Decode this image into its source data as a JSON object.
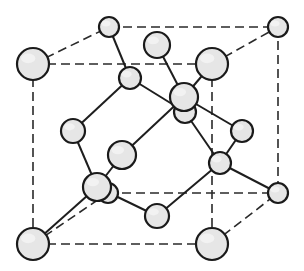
{
  "diagram": {
    "colors": {
      "atom_fill": "#e6e6e6",
      "atom_stroke": "#1a1a1a",
      "edge_stroke": "#2a2a2a",
      "background": "#ffffff"
    },
    "cube_edges": [
      {
        "from": [
          33,
          64
        ],
        "to": [
          212,
          64
        ]
      },
      {
        "from": [
          33,
          64
        ],
        "to": [
          33,
          244
        ]
      },
      {
        "from": [
          212,
          64
        ],
        "to": [
          212,
          244
        ]
      },
      {
        "from": [
          33,
          244
        ],
        "to": [
          212,
          244
        ]
      },
      {
        "from": [
          109,
          27
        ],
        "to": [
          278,
          27
        ]
      },
      {
        "from": [
          278,
          27
        ],
        "to": [
          278,
          193
        ]
      },
      {
        "from": [
          108,
          193
        ],
        "to": [
          278,
          193
        ]
      },
      {
        "from": [
          33,
          64
        ],
        "to": [
          109,
          27
        ]
      },
      {
        "from": [
          212,
          64
        ],
        "to": [
          278,
          27
        ]
      },
      {
        "from": [
          212,
          244
        ],
        "to": [
          278,
          193
        ]
      },
      {
        "from": [
          33,
          244
        ],
        "to": [
          108,
          193
        ]
      }
    ],
    "bonds": [
      {
        "from": [
          184,
          97
        ],
        "to": [
          157,
          45
        ]
      },
      {
        "from": [
          184,
          97
        ],
        "to": [
          212,
          64
        ]
      },
      {
        "from": [
          184,
          97
        ],
        "to": [
          242,
          131
        ]
      },
      {
        "from": [
          184,
          97
        ],
        "to": [
          122,
          155
        ]
      },
      {
        "from": [
          130,
          78
        ],
        "to": [
          109,
          27
        ]
      },
      {
        "from": [
          130,
          78
        ],
        "to": [
          73,
          131
        ]
      },
      {
        "from": [
          130,
          78
        ],
        "to": [
          185,
          112
        ]
      },
      {
        "from": [
          97,
          187
        ],
        "to": [
          73,
          131
        ]
      },
      {
        "from": [
          97,
          187
        ],
        "to": [
          122,
          155
        ]
      },
      {
        "from": [
          97,
          187
        ],
        "to": [
          33,
          244
        ]
      },
      {
        "from": [
          97,
          187
        ],
        "to": [
          157,
          216
        ]
      },
      {
        "from": [
          220,
          163
        ],
        "to": [
          185,
          112
        ]
      },
      {
        "from": [
          220,
          163
        ],
        "to": [
          278,
          193
        ]
      },
      {
        "from": [
          220,
          163
        ],
        "to": [
          157,
          216
        ]
      },
      {
        "from": [
          220,
          163
        ],
        "to": [
          242,
          131
        ]
      }
    ],
    "atoms": [
      {
        "name": "corner-back-bottom-left",
        "cx": 108,
        "cy": 193,
        "r": 10
      },
      {
        "name": "face-center-back",
        "cx": 185,
        "cy": 112,
        "r": 11
      },
      {
        "name": "corner-back-top-left",
        "cx": 109,
        "cy": 27,
        "r": 10
      },
      {
        "name": "corner-back-top-right",
        "cx": 278,
        "cy": 27,
        "r": 10
      },
      {
        "name": "corner-back-bottom-right",
        "cx": 278,
        "cy": 193,
        "r": 10
      },
      {
        "name": "face-center-top",
        "cx": 157,
        "cy": 45,
        "r": 13
      },
      {
        "name": "tetrahedral-1",
        "cx": 130,
        "cy": 78,
        "r": 11
      },
      {
        "name": "face-center-left",
        "cx": 73,
        "cy": 131,
        "r": 12
      },
      {
        "name": "face-center-right",
        "cx": 242,
        "cy": 131,
        "r": 11
      },
      {
        "name": "tetrahedral-2",
        "cx": 184,
        "cy": 97,
        "r": 14
      },
      {
        "name": "tetrahedral-3",
        "cx": 220,
        "cy": 163,
        "r": 11
      },
      {
        "name": "face-center-front",
        "cx": 122,
        "cy": 155,
        "r": 14
      },
      {
        "name": "face-center-bottom",
        "cx": 157,
        "cy": 216,
        "r": 12
      },
      {
        "name": "tetrahedral-4",
        "cx": 97,
        "cy": 187,
        "r": 14
      },
      {
        "name": "corner-front-top-left",
        "cx": 33,
        "cy": 64,
        "r": 16
      },
      {
        "name": "corner-front-top-right",
        "cx": 212,
        "cy": 64,
        "r": 16
      },
      {
        "name": "corner-front-bottom-left",
        "cx": 33,
        "cy": 244,
        "r": 16
      },
      {
        "name": "corner-front-bottom-right",
        "cx": 212,
        "cy": 244,
        "r": 16
      }
    ]
  }
}
